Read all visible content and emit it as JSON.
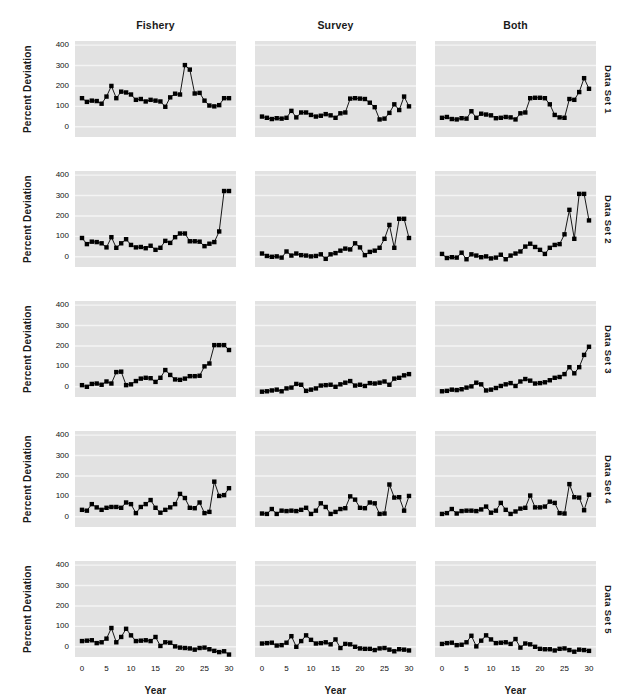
{
  "figure": {
    "background": "#ffffff",
    "panel_background": "#e2e2e2",
    "grid_color": "#f4f4f4",
    "series_color": "#000000",
    "ylabel": "Percent Deviation",
    "xlabel": "Year",
    "column_titles": [
      "Fishery",
      "Survey",
      "Both"
    ],
    "row_titles": [
      "Data Set 1",
      "Data Set 2",
      "Data Set 3",
      "Data Set 4",
      "Data Set 5"
    ],
    "y_ticks": [
      "400",
      "300",
      "200",
      "100",
      "0"
    ],
    "x_ticks": [
      "0",
      "5",
      "10",
      "15",
      "20",
      "25",
      "30"
    ]
  },
  "chart_data": {
    "type": "line",
    "title": "",
    "subtitle": "",
    "xlabel": "Year",
    "ylabel": "Percent Deviation",
    "xlim": [
      0,
      30
    ],
    "ylim": [
      -50,
      420
    ],
    "y_ticks": [
      0,
      100,
      200,
      300,
      400
    ],
    "x_ticks": [
      0,
      5,
      10,
      15,
      20,
      25,
      30
    ],
    "grid": true,
    "legend": "none",
    "layout": {
      "rows": 5,
      "cols": 3,
      "row_labels": [
        "Data Set 1",
        "Data Set 2",
        "Data Set 3",
        "Data Set 4",
        "Data Set 5"
      ],
      "col_labels": [
        "Fishery",
        "Survey",
        "Both"
      ]
    },
    "marker": "filled-square",
    "x": [
      0,
      1,
      2,
      3,
      4,
      5,
      6,
      7,
      8,
      9,
      10,
      11,
      12,
      13,
      14,
      15,
      16,
      17,
      18,
      19,
      20,
      21,
      22,
      23,
      24,
      25,
      26,
      27,
      28,
      29,
      30
    ],
    "panels": [
      {
        "row": "Data Set 1",
        "col": "Fishery",
        "values": [
          140,
          122,
          128,
          126,
          113,
          148,
          200,
          140,
          172,
          168,
          158,
          132,
          136,
          124,
          132,
          128,
          124,
          98,
          144,
          162,
          158,
          302,
          280,
          163,
          166,
          128,
          104,
          100,
          106,
          140,
          140
        ]
      },
      {
        "row": "Data Set 1",
        "col": "Survey",
        "values": [
          50,
          44,
          38,
          42,
          40,
          44,
          78,
          46,
          70,
          70,
          58,
          50,
          54,
          62,
          56,
          44,
          66,
          70,
          138,
          140,
          138,
          136,
          118,
          96,
          36,
          40,
          68,
          110,
          82,
          148,
          100
        ]
      },
      {
        "row": "Data Set 1",
        "col": "Both",
        "values": [
          44,
          48,
          38,
          36,
          42,
          40,
          76,
          44,
          64,
          60,
          56,
          42,
          44,
          48,
          46,
          36,
          66,
          70,
          140,
          142,
          142,
          140,
          110,
          58,
          46,
          44,
          136,
          132,
          170,
          238,
          186
        ]
      },
      {
        "row": "Data Set 2",
        "col": "Fishery",
        "values": [
          92,
          62,
          74,
          72,
          66,
          46,
          96,
          44,
          66,
          86,
          58,
          46,
          48,
          42,
          54,
          34,
          44,
          78,
          68,
          96,
          114,
          114,
          76,
          76,
          74,
          52,
          64,
          72,
          124,
          322,
          322
        ]
      },
      {
        "row": "Data Set 2",
        "col": "Survey",
        "values": [
          16,
          4,
          0,
          2,
          -4,
          26,
          6,
          16,
          8,
          6,
          2,
          4,
          12,
          -10,
          12,
          18,
          30,
          40,
          36,
          66,
          46,
          8,
          24,
          30,
          44,
          88,
          156,
          44,
          186,
          186,
          92
        ]
      },
      {
        "row": "Data Set 2",
        "col": "Both",
        "values": [
          14,
          -6,
          -2,
          -4,
          20,
          -12,
          12,
          6,
          -2,
          2,
          -8,
          -4,
          10,
          -12,
          6,
          16,
          26,
          50,
          64,
          48,
          34,
          14,
          44,
          58,
          62,
          110,
          230,
          88,
          308,
          308,
          178
        ]
      },
      {
        "row": "Data Set 3",
        "col": "Fishery",
        "values": [
          8,
          0,
          14,
          16,
          10,
          26,
          16,
          72,
          74,
          8,
          12,
          28,
          40,
          44,
          42,
          24,
          44,
          82,
          58,
          36,
          34,
          40,
          52,
          52,
          54,
          100,
          114,
          204,
          204,
          204,
          180
        ]
      },
      {
        "row": "Data Set 3",
        "col": "Survey",
        "values": [
          -24,
          -22,
          -18,
          -14,
          -22,
          -8,
          -4,
          14,
          10,
          -20,
          -14,
          -8,
          6,
          8,
          10,
          0,
          12,
          20,
          28,
          6,
          10,
          4,
          18,
          16,
          20,
          26,
          10,
          40,
          44,
          56,
          62
        ]
      },
      {
        "row": "Data Set 3",
        "col": "Both",
        "values": [
          -22,
          -20,
          -14,
          -16,
          -12,
          -4,
          2,
          20,
          12,
          -18,
          -14,
          -6,
          4,
          12,
          18,
          4,
          26,
          38,
          30,
          16,
          18,
          22,
          32,
          44,
          48,
          62,
          96,
          66,
          96,
          156,
          196
        ]
      },
      {
        "row": "Data Set 4",
        "col": "Fishery",
        "values": [
          34,
          30,
          62,
          46,
          34,
          44,
          48,
          48,
          44,
          70,
          62,
          18,
          48,
          62,
          82,
          44,
          20,
          34,
          46,
          62,
          112,
          92,
          44,
          42,
          70,
          18,
          24,
          172,
          102,
          106,
          140
        ]
      },
      {
        "row": "Data Set 4",
        "col": "Survey",
        "values": [
          16,
          14,
          38,
          14,
          30,
          28,
          30,
          28,
          34,
          44,
          14,
          30,
          66,
          48,
          14,
          24,
          38,
          42,
          100,
          84,
          44,
          42,
          70,
          66,
          14,
          16,
          158,
          94,
          96,
          30,
          102
        ]
      },
      {
        "row": "Data Set 4",
        "col": "Both",
        "values": [
          14,
          18,
          38,
          16,
          28,
          30,
          30,
          28,
          36,
          50,
          20,
          30,
          68,
          34,
          14,
          26,
          40,
          44,
          104,
          46,
          46,
          50,
          74,
          68,
          18,
          16,
          160,
          96,
          94,
          32,
          108
        ]
      },
      {
        "row": "Data Set 5",
        "col": "Fishery",
        "values": [
          28,
          30,
          32,
          18,
          22,
          40,
          92,
          22,
          48,
          88,
          56,
          28,
          30,
          32,
          28,
          48,
          4,
          22,
          20,
          2,
          -4,
          -6,
          -8,
          -14,
          -6,
          -4,
          -12,
          -20,
          -26,
          -22,
          -38
        ]
      },
      {
        "row": "Data Set 5",
        "col": "Survey",
        "values": [
          16,
          18,
          20,
          6,
          8,
          20,
          52,
          0,
          28,
          56,
          34,
          16,
          18,
          22,
          12,
          36,
          -6,
          14,
          12,
          0,
          -8,
          -10,
          -10,
          -16,
          -8,
          -6,
          -14,
          -22,
          -12,
          -14,
          -18
        ]
      },
      {
        "row": "Data Set 5",
        "col": "Both",
        "values": [
          14,
          18,
          20,
          8,
          10,
          22,
          54,
          2,
          30,
          56,
          36,
          18,
          20,
          22,
          14,
          38,
          -4,
          16,
          12,
          0,
          -10,
          -12,
          -12,
          -18,
          -10,
          -8,
          -16,
          -24,
          -14,
          -16,
          -20
        ]
      }
    ]
  }
}
